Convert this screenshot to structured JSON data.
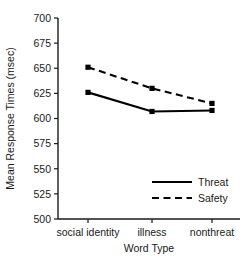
{
  "chart_data": {
    "type": "line",
    "title": "",
    "xlabel": "Word Type",
    "ylabel": "Mean Response Times (msec)",
    "categories": [
      "social identity",
      "illness",
      "nonthreat"
    ],
    "ylim": [
      500,
      700
    ],
    "yticks": [
      500,
      525,
      550,
      575,
      600,
      625,
      650,
      675,
      700
    ],
    "ytick_labels": [
      "500",
      "525",
      "550",
      "575",
      "600",
      "625",
      "650",
      "675",
      "700"
    ],
    "grid": false,
    "legend_position": "lower-right inside plot",
    "series": [
      {
        "name": "Threat",
        "style": "solid",
        "marker": "square",
        "color": "#000000",
        "values": [
          626,
          607,
          608
        ]
      },
      {
        "name": "Safety",
        "style": "dashed",
        "marker": "square",
        "color": "#000000",
        "values": [
          651,
          630,
          615
        ]
      }
    ]
  },
  "legend": {
    "entries": [
      {
        "label": "Threat",
        "style": "solid"
      },
      {
        "label": "Safety",
        "style": "dashed"
      }
    ]
  }
}
